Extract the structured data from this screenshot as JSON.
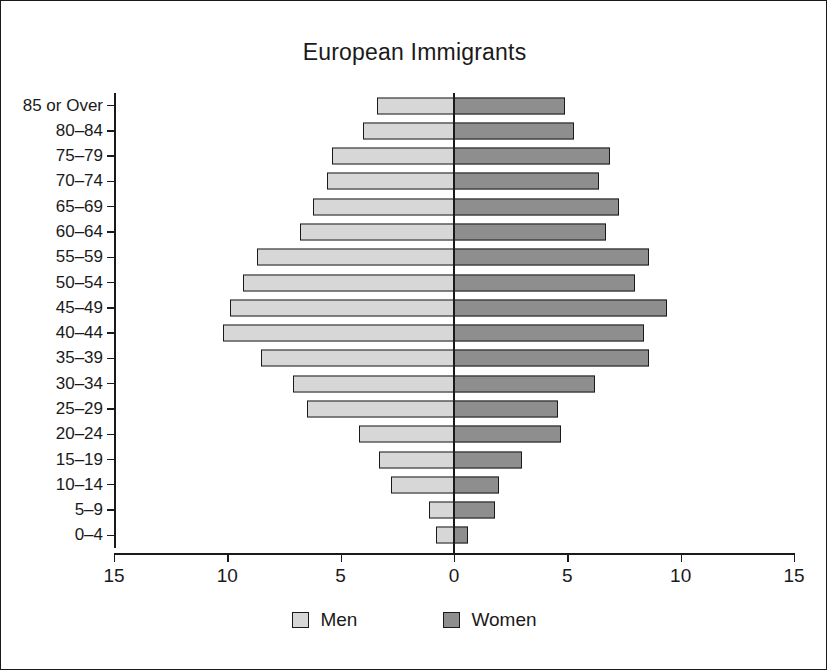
{
  "chart_data": {
    "type": "bar",
    "subtype": "population-pyramid",
    "title": "European Immigrants",
    "xlabel": "",
    "ylabel": "",
    "orientation": "horizontal",
    "grid": false,
    "legend_position": "bottom",
    "categories": [
      "85 or Over",
      "80–84",
      "75–79",
      "70–74",
      "65–69",
      "60–64",
      "55–59",
      "50–54",
      "45–49",
      "40–44",
      "35–39",
      "30–34",
      "25–29",
      "20–24",
      "15–19",
      "10–14",
      "5–9",
      "0–4"
    ],
    "series": [
      {
        "name": "Men",
        "color": "#d7d7d7",
        "direction": "left",
        "values": [
          3.4,
          4.0,
          5.4,
          5.6,
          6.2,
          6.8,
          8.7,
          9.3,
          9.9,
          10.2,
          8.5,
          7.1,
          6.5,
          4.2,
          3.3,
          2.8,
          1.1,
          0.8
        ]
      },
      {
        "name": "Women",
        "color": "#8e8e8e",
        "direction": "right",
        "values": [
          4.9,
          5.3,
          6.9,
          6.4,
          7.3,
          6.7,
          8.6,
          8.0,
          9.4,
          8.4,
          8.6,
          6.2,
          4.6,
          4.7,
          3.0,
          2.0,
          1.8,
          0.6
        ]
      }
    ],
    "xlim": [
      -15,
      15
    ],
    "x_tick_values": [
      -15,
      -10,
      -5,
      0,
      5,
      10,
      15
    ],
    "x_tick_labels": [
      "15",
      "10",
      "5",
      "0",
      "5",
      "10",
      "15"
    ]
  },
  "legend": {
    "items": [
      {
        "label": "Men",
        "color": "#d7d7d7"
      },
      {
        "label": "Women",
        "color": "#8e8e8e"
      }
    ]
  },
  "colors": {
    "men": "#d7d7d7",
    "women": "#8e8e8e",
    "axis": "#1a1a1a",
    "background": "#ffffff"
  }
}
